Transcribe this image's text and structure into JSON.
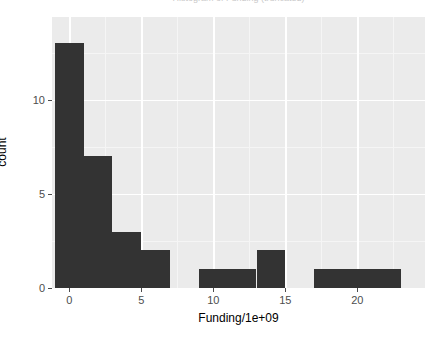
{
  "chart_data": {
    "type": "bar",
    "title": "Histogram of Funding (truncated)",
    "xlabel": "Funding/1e+09",
    "ylabel": "count",
    "xlim": [
      -1.2,
      24.7
    ],
    "ylim": [
      0,
      14.4
    ],
    "grid": true,
    "legend": "none",
    "bar_color": "#333333",
    "panel_color": "#ebebeb",
    "gridline_color": "#ffffff",
    "binwidth": 2,
    "x_ticks": [
      {
        "value": 0,
        "label": "0"
      },
      {
        "value": 5,
        "label": "5"
      },
      {
        "value": 10,
        "label": "10"
      },
      {
        "value": 15,
        "label": "15"
      },
      {
        "value": 20,
        "label": "20"
      }
    ],
    "y_ticks": [
      {
        "value": 0,
        "label": "0"
      },
      {
        "value": 5,
        "label": "5"
      },
      {
        "value": 10,
        "label": "10"
      }
    ],
    "x_minor_ticks": [
      -2.5,
      2.5,
      7.5,
      12.5,
      17.5,
      22.5
    ],
    "y_minor_ticks": [
      2.5,
      7.5,
      12.5
    ],
    "bins": [
      {
        "x0": -1,
        "x1": 1,
        "count": 13
      },
      {
        "x0": 1,
        "x1": 3,
        "count": 7
      },
      {
        "x0": 3,
        "x1": 5,
        "count": 3
      },
      {
        "x0": 5,
        "x1": 7,
        "count": 2
      },
      {
        "x0": 7,
        "x1": 9,
        "count": 0
      },
      {
        "x0": 9,
        "x1": 11,
        "count": 1
      },
      {
        "x0": 11,
        "x1": 13,
        "count": 1
      },
      {
        "x0": 13,
        "x1": 15,
        "count": 2
      },
      {
        "x0": 15,
        "x1": 17,
        "count": 0
      },
      {
        "x0": 17,
        "x1": 19,
        "count": 1
      },
      {
        "x0": 19,
        "x1": 21,
        "count": 1
      },
      {
        "x0": 21,
        "x1": 23,
        "count": 1
      }
    ],
    "categories": [
      "-1 to 1",
      "1 to 3",
      "3 to 5",
      "5 to 7",
      "7 to 9",
      "9 to 11",
      "11 to 13",
      "13 to 15",
      "15 to 17",
      "17 to 19",
      "19 to 21",
      "21 to 23"
    ],
    "values": [
      13,
      7,
      3,
      2,
      0,
      1,
      1,
      2,
      0,
      1,
      1,
      1
    ]
  }
}
